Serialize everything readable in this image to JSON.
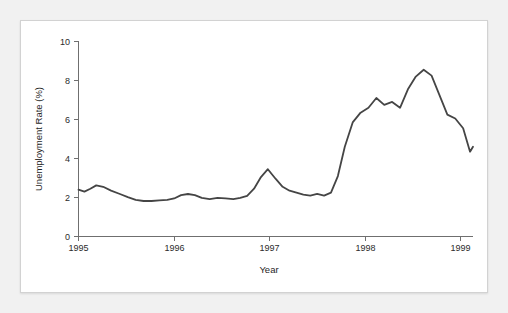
{
  "card": {
    "background_color": "#ffffff",
    "border_color": "#d2d2d2"
  },
  "page": {
    "background_color": "#f1f1f1"
  },
  "chart_data": {
    "type": "line",
    "title": "",
    "subtitle": "",
    "xlabel": "Year",
    "ylabel": "Unemployment Rate (%)",
    "xlim": [
      1995,
      1999
    ],
    "ylim": [
      0,
      10
    ],
    "xticks": [
      1995,
      1996,
      1997,
      1998,
      1999
    ],
    "xtick_labels": [
      "1995",
      "1996",
      "1997",
      "1998",
      "1999"
    ],
    "yticks": [
      0,
      2,
      4,
      6,
      8,
      10
    ],
    "ytick_labels": [
      "0",
      "2",
      "4",
      "6",
      "8",
      "10"
    ],
    "grid": false,
    "legend": null,
    "legend_position": "none",
    "line_color": "#454545",
    "line_width": 1.8,
    "series": [
      {
        "name": "Unemployment Rate",
        "x": [
          1995.0,
          1995.06,
          1995.12,
          1995.18,
          1995.25,
          1995.33,
          1995.42,
          1995.5,
          1995.58,
          1995.66,
          1995.74,
          1995.82,
          1995.9,
          1995.97,
          1996.04,
          1996.11,
          1996.18,
          1996.25,
          1996.33,
          1996.41,
          1996.49,
          1996.57,
          1996.64,
          1996.71,
          1996.78,
          1996.85,
          1996.92,
          1997.0,
          1997.07,
          1997.14,
          1997.21,
          1997.28,
          1997.35,
          1997.42,
          1997.49,
          1997.56,
          1997.63,
          1997.7,
          1997.78,
          1997.86,
          1997.94,
          1998.02,
          1998.1,
          1998.18,
          1998.26,
          1998.34,
          1998.42,
          1998.5,
          1998.58,
          1998.66,
          1998.74,
          1998.82,
          1998.9,
          1998.97,
          1999.0
        ],
        "values": [
          2.4,
          2.3,
          2.45,
          2.62,
          2.55,
          2.35,
          2.18,
          2.02,
          1.88,
          1.82,
          1.82,
          1.85,
          1.88,
          1.95,
          2.12,
          2.18,
          2.12,
          1.98,
          1.92,
          1.98,
          1.95,
          1.92,
          1.98,
          2.08,
          2.45,
          3.05,
          3.45,
          2.95,
          2.55,
          2.35,
          2.25,
          2.15,
          2.1,
          2.18,
          2.1,
          2.25,
          3.1,
          4.6,
          5.85,
          6.35,
          6.6,
          7.1,
          6.75,
          6.9,
          6.6,
          7.55,
          8.2,
          8.55,
          8.25,
          7.25,
          6.25,
          6.05,
          5.55,
          4.35,
          4.6
        ]
      }
    ],
    "annotations": []
  }
}
